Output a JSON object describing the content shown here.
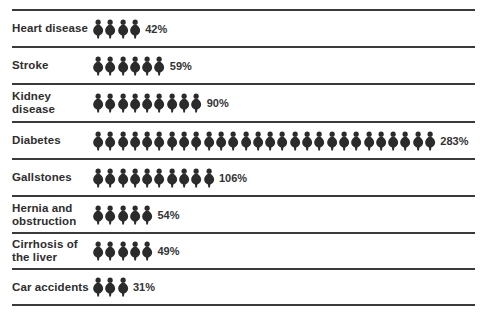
{
  "chart_data": {
    "type": "bar",
    "style": "pictogram",
    "title": "",
    "xlabel": "",
    "ylabel": "",
    "unit_note": "each figure ≈ 10%",
    "categories": [
      "Heart disease",
      "Stroke",
      "Kidney disease",
      "Diabetes",
      "Gallstones",
      "Hernia and obstruction",
      "Cirrhosis of the liver",
      "Car accidents"
    ],
    "values": [
      42,
      59,
      90,
      283,
      106,
      54,
      49,
      31
    ],
    "value_labels": [
      "42%",
      "59%",
      "90%",
      "283%",
      "106%",
      "54%",
      "49%",
      "31%"
    ],
    "icon_counts": [
      4,
      6,
      9,
      28,
      10,
      5,
      5,
      3
    ],
    "grid": false,
    "legend": null,
    "icon": "person-silhouette-icon",
    "icon_color": "#2b2b2b"
  },
  "rows": [
    {
      "label_line1": "Heart disease",
      "label_line2": "",
      "value": "42%",
      "count": 4
    },
    {
      "label_line1": "Stroke",
      "label_line2": "",
      "value": "59%",
      "count": 6
    },
    {
      "label_line1": "Kidney",
      "label_line2": "disease",
      "value": "90%",
      "count": 9
    },
    {
      "label_line1": "Diabetes",
      "label_line2": "",
      "value": "283%",
      "count": 28
    },
    {
      "label_line1": "Gallstones",
      "label_line2": "",
      "value": "106%",
      "count": 10
    },
    {
      "label_line1": "Hernia and",
      "label_line2": "obstruction",
      "value": "54%",
      "count": 5
    },
    {
      "label_line1": "Cirrhosis of",
      "label_line2": "the liver",
      "value": "49%",
      "count": 5
    },
    {
      "label_line1": "Car accidents",
      "label_line2": "",
      "value": "31%",
      "count": 3
    }
  ]
}
